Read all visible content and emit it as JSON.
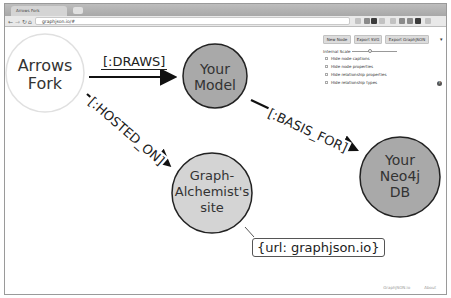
{
  "browser": {
    "tab_title": "Arrows Fork",
    "url": "graphjson.io/#",
    "nav": {
      "back": "←",
      "forward": "→",
      "reload": "↻",
      "home": "⌂"
    }
  },
  "panel": {
    "buttons": [
      "New Node",
      "Export SVG",
      "Export GraphJSON"
    ],
    "menu_caret": "▾",
    "scale_label": "Internal Scale",
    "options": [
      "Hide node captions",
      "Hide node properties",
      "Hide relationship properties",
      "Hide relationship types"
    ],
    "help_icon": "?"
  },
  "graph": {
    "nodes": [
      {
        "id": "arrows-fork",
        "lines": [
          "Arrows",
          "Fork"
        ],
        "fill": "#ffffff",
        "stroke": "#dddddd"
      },
      {
        "id": "your-model",
        "lines": [
          "Your",
          "Model"
        ],
        "fill": "#a9a9a9",
        "stroke": "#222222"
      },
      {
        "id": "your-neo4j-db",
        "lines": [
          "Your",
          "Neo4j",
          "DB"
        ],
        "fill": "#a9a9a9",
        "stroke": "#222222"
      },
      {
        "id": "graph-alchemist-site",
        "lines": [
          "Graph-",
          "Alchemist's",
          "site"
        ],
        "fill": "#d4d4d4",
        "stroke": "#222222"
      }
    ],
    "edges": [
      {
        "from": "arrows-fork",
        "to": "your-model",
        "label": "[:DRAWS]"
      },
      {
        "from": "your-model",
        "to": "your-neo4j-db",
        "label": "[:BASIS_FOR]"
      },
      {
        "from": "arrows-fork",
        "to": "graph-alchemist-site",
        "label": "[:HOSTED_ON]"
      }
    ],
    "property": "{url: graphjson.io}"
  },
  "footer": {
    "links": [
      "GraphJSON.io",
      "About"
    ]
  }
}
